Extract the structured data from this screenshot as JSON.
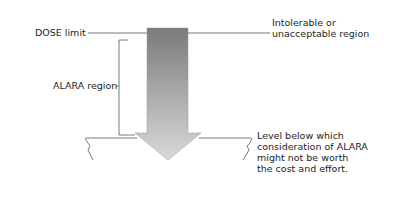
{
  "diagram": {
    "labels": {
      "dose_limit": "DOSE limit",
      "intolerable_line1": "Intolerable or",
      "intolerable_line2": "unacceptable region",
      "alara_region": "ALARA region",
      "level_below_1": "Level below which",
      "level_below_2": "consideration of ALARA",
      "level_below_3": "might not be worth",
      "level_below_4": "the cost and effort."
    },
    "colors": {
      "arrow_top": "#7a7a7a",
      "arrow_bottom": "#d6d6d6",
      "line": "#555555",
      "text": "#1e1e1e"
    }
  }
}
